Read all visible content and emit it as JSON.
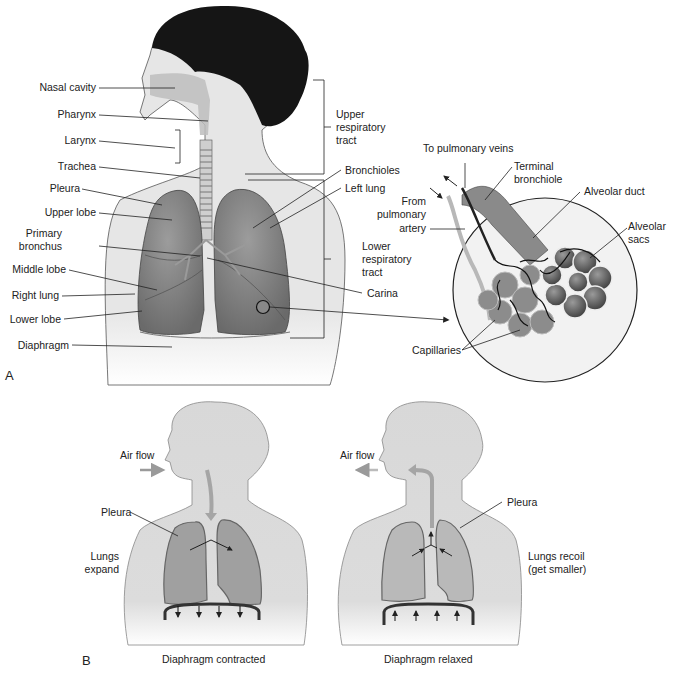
{
  "figure": {
    "panel_a": {
      "letter": "A",
      "labels_left": {
        "nasal_cavity": "Nasal cavity",
        "pharynx": "Pharynx",
        "larynx": "Larynx",
        "trachea": "Trachea",
        "pleura": "Pleura",
        "upper_lobe": "Upper lobe",
        "primary_bronchus_1": "Primary",
        "primary_bronchus_2": "bronchus",
        "middle_lobe": "Middle lobe",
        "right_lung": "Right lung",
        "lower_lobe": "Lower lobe",
        "diaphragm": "Diaphragm"
      },
      "labels_right": {
        "upper_tract_1": "Upper",
        "upper_tract_2": "respiratory",
        "upper_tract_3": "tract",
        "bronchioles": "Bronchioles",
        "left_lung": "Left lung",
        "lower_tract_1": "Lower",
        "lower_tract_2": "respiratory",
        "lower_tract_3": "tract",
        "carina": "Carina"
      },
      "inset_labels": {
        "to_pulmonary_veins": "To pulmonary veins",
        "terminal_bronchiole_1": "Terminal",
        "terminal_bronchiole_2": "bronchiole",
        "alveolar_duct": "Alveolar duct",
        "from_pa_1": "From",
        "from_pa_2": "pulmonary",
        "from_pa_3": "artery",
        "alveolar_sacs_1": "Alveolar",
        "alveolar_sacs_2": "sacs",
        "capillaries": "Capillaries"
      }
    },
    "panel_b": {
      "letter": "B",
      "left": {
        "air_flow": "Air flow",
        "pleura": "Pleura",
        "state_1": "Lungs",
        "state_2": "expand",
        "caption": "Diaphragm contracted"
      },
      "right": {
        "air_flow": "Air flow",
        "pleura": "Pleura",
        "state_1": "Lungs recoil",
        "state_2": "(get smaller)",
        "caption": "Diaphragm relaxed"
      }
    },
    "colors": {
      "hair": "#141414",
      "skin": "#e9e9e9",
      "lung": "#8a8a8a",
      "lung_light": "#a8a8a8",
      "silhouette": "#d9d9d9",
      "b_lung": "#a3a3a3",
      "airflow": "#a0a0a0",
      "line": "#222222"
    }
  }
}
